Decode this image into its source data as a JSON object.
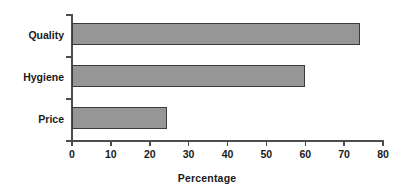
{
  "chart_data": {
    "type": "bar",
    "orientation": "horizontal",
    "title": "",
    "subtitle": "",
    "categories": [
      "Quality",
      "Hygiene",
      "Price"
    ],
    "values": [
      74,
      60,
      24.5
    ],
    "series": [
      {
        "name": "Percentage",
        "values": [
          74,
          60,
          24.5
        ]
      }
    ],
    "xlabel": "Percentage",
    "ylabel": "",
    "xlim": [
      0,
      80
    ],
    "xticks": [
      0,
      10,
      20,
      30,
      40,
      50,
      60,
      70,
      80
    ],
    "xtick_labels": [
      "0",
      "10",
      "20",
      "30",
      "40",
      "50",
      "60",
      "70",
      "80"
    ],
    "grid": false,
    "legend": false,
    "legend_position": "none",
    "bar_fill_color": "#969696",
    "bar_border_color": "#3a3a3a",
    "axis_color": "#4d4d4d",
    "text_color": "#1a1a1a",
    "background_color": "#ffffff"
  },
  "axis": {
    "x_title": "Percentage"
  },
  "categories": [
    {
      "label": "Quality",
      "value": 74
    },
    {
      "label": "Hygiene",
      "value": 60
    },
    {
      "label": "Price",
      "value": 24.5
    }
  ],
  "xticks": [
    {
      "label": "0",
      "value": 0
    },
    {
      "label": "10",
      "value": 10
    },
    {
      "label": "20",
      "value": 20
    },
    {
      "label": "30",
      "value": 30
    },
    {
      "label": "40",
      "value": 40
    },
    {
      "label": "50",
      "value": 50
    },
    {
      "label": "60",
      "value": 60
    },
    {
      "label": "70",
      "value": 70
    },
    {
      "label": "80",
      "value": 80
    }
  ]
}
